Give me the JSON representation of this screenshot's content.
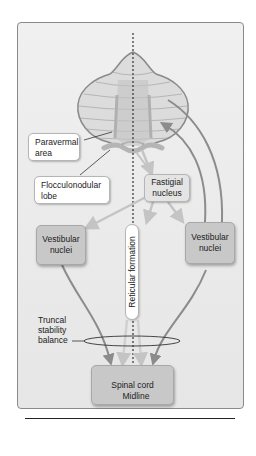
{
  "figure": {
    "labels": {
      "paravermal_area": "Paravermal area",
      "flocculonodular_lobe": "Flocculonodular lobe",
      "fastigial_nucleus": "Fastigial nucleus",
      "vestibular_nuclei_left": "Vestibular nuclei",
      "vestibular_nuclei_right": "Vestibular nuclei",
      "reticular_formation": "Reticular formation",
      "truncal_stability": "Truncal stability balance",
      "spinal_cord": "Spinal cord",
      "midline": "Midline"
    },
    "colors": {
      "panel_bg": "#ececec",
      "cerebellum_fill": "#dcdcdc",
      "cerebellum_stroke": "#8a8a8a",
      "vermis_fill": "#c4c4c4",
      "arrow_dark": "#8c8c8c",
      "arrow_light": "#c9c9c9",
      "box_gray": "#c8c8c8"
    }
  }
}
